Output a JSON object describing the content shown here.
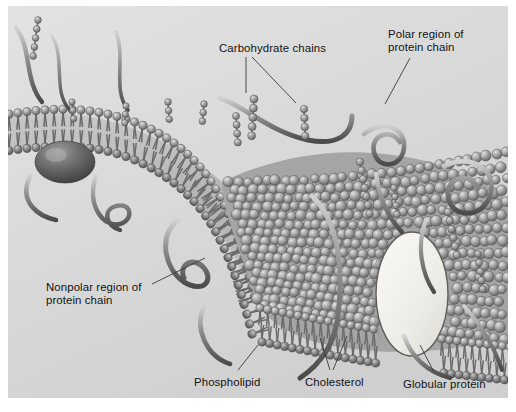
{
  "figure": {
    "style": "grayscale pencil/airbrush textbook illustration",
    "panel": {
      "background_color": "#dcdcdc",
      "border_color": "#9a9a9a",
      "outer_background": "#ffffff"
    }
  },
  "labels": [
    {
      "id": "carbohydrate-chains",
      "text": "Carbohydrate chains",
      "x": 219,
      "y": 42
    },
    {
      "id": "polar-region",
      "text": "Polar region of\nprotein chain",
      "x": 388,
      "y": 28
    },
    {
      "id": "nonpolar-region",
      "text": "Nonpolar region of\nprotein chain",
      "x": 46,
      "y": 281
    },
    {
      "id": "phospholipid",
      "text": "Phospholipid",
      "x": 194,
      "y": 376
    },
    {
      "id": "cholesterol",
      "text": "Cholesterol",
      "x": 305,
      "y": 376
    },
    {
      "id": "globular-protein",
      "text": "Globular protein",
      "x": 403,
      "y": 378
    }
  ],
  "leader_lines": [
    {
      "id": "carb-leader-left",
      "from": [
        246,
        57
      ],
      "to": [
        246,
        93
      ]
    },
    {
      "id": "carb-leader-right",
      "from": [
        252,
        57
      ],
      "to": [
        296,
        103
      ]
    },
    {
      "id": "polar-leader",
      "from": [
        410,
        58
      ],
      "to": [
        385,
        104
      ]
    },
    {
      "id": "nonpolar-leader",
      "from": [
        152,
        284
      ],
      "to": [
        205,
        258
      ]
    },
    {
      "id": "phospholipid-leader",
      "from": [
        238,
        370
      ],
      "to": [
        258,
        345
      ]
    },
    {
      "id": "cholesterol-leader-a",
      "from": [
        330,
        370
      ],
      "to": [
        320,
        338
      ]
    },
    {
      "id": "cholesterol-leader-b",
      "from": [
        333,
        370
      ],
      "to": [
        347,
        336
      ]
    },
    {
      "id": "globular-leader",
      "from": [
        434,
        372
      ],
      "to": [
        420,
        345
      ]
    }
  ],
  "structures": {
    "bilayer": {
      "head_count_upper": 64,
      "head_count_lower": 64,
      "description": "two leaflets of spherical phospholipid heads with thin hydrophobic tails meeting in the interior"
    },
    "surface_mosaic": {
      "description": "cobblestone field of phospholipid heads seen from above on the right half"
    },
    "globular_protein": {
      "description": "large pale ellipse spanning the bilayer at the lower right",
      "fill": "#f0efec"
    },
    "embedded_dome": {
      "description": "dark dome-shaped protein embedded in the membrane at the left",
      "fill": "#6f6f6f"
    },
    "carbohydrate_chains": {
      "description": "beaded strings of small spheres projecting from the outer surface",
      "count": 12
    },
    "protein_coils": {
      "description": "tube-like protein chains looping and coiling above and below the membrane",
      "count": 8
    }
  },
  "palette": {
    "ink": "#131313",
    "leader": "#3a3a3a",
    "head_light": "#cfcfcf",
    "head_mid": "#9b9b9b",
    "head_dark": "#6a6a6a",
    "tail": "#6b6b6b",
    "tube_light": "#c9c9c9",
    "tube_dark": "#5a5a5a",
    "interior": "#bdbdbd"
  }
}
